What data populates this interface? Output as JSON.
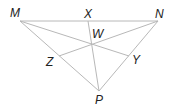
{
  "diagram": {
    "line_color": "#b8b8b8",
    "label_color": "#222222",
    "points": {
      "M": {
        "label": "M",
        "x": 20,
        "y": 21,
        "lx": 10,
        "ly": 17
      },
      "N": {
        "label": "N",
        "x": 158,
        "y": 21,
        "lx": 155,
        "ly": 18
      },
      "X": {
        "label": "X",
        "x": 88,
        "y": 21,
        "lx": 84,
        "ly": 18
      },
      "W": {
        "label": "W",
        "x": 90,
        "y": 45,
        "lx": 92,
        "ly": 38
      },
      "Z": {
        "label": "Z",
        "x": 59,
        "y": 56,
        "lx": 46,
        "ly": 66
      },
      "Y": {
        "label": "Y",
        "x": 129,
        "y": 56,
        "lx": 132,
        "ly": 64
      },
      "P": {
        "label": "P",
        "x": 99,
        "y": 91,
        "lx": 95,
        "ly": 104
      }
    },
    "segments": [
      [
        "M",
        "N"
      ],
      [
        "N",
        "P"
      ],
      [
        "P",
        "M"
      ],
      [
        "X",
        "P"
      ],
      [
        "M",
        "Y"
      ],
      [
        "N",
        "Z"
      ]
    ]
  }
}
